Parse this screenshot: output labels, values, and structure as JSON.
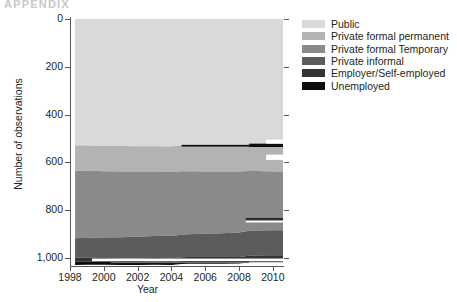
{
  "running_head": "APPENDIX",
  "chart_data": {
    "type": "area",
    "stacked": true,
    "title": "",
    "xlabel": "Year",
    "ylabel": "Number of observations",
    "xlim": [
      1998,
      2010.6
    ],
    "ylim": [
      0,
      1030
    ],
    "y_inverted": true,
    "grid": false,
    "legend_position": "right",
    "x_ticks": [
      1998,
      2000,
      2002,
      2004,
      2006,
      2008,
      2010
    ],
    "x_tick_labels": [
      "1998",
      "2000",
      "2002",
      "2004",
      "2006",
      "2008",
      "2010"
    ],
    "y_ticks": [
      0,
      200,
      400,
      600,
      800,
      1000
    ],
    "y_tick_labels": [
      "0",
      "200",
      "400",
      "600",
      "800",
      "1,000"
    ],
    "x": [
      1998.3,
      1999,
      2000,
      2001,
      2002,
      2003,
      2004,
      2004.6,
      2005,
      2006,
      2007,
      2008,
      2008.6,
      2009,
      2010,
      2010.6
    ],
    "series": [
      {
        "name": "Public",
        "color": "#d9d9d9",
        "values": [
          530,
          530,
          532,
          532,
          533,
          533,
          534,
          529,
          529,
          529,
          529,
          529,
          524,
          524,
          525,
          525
        ]
      },
      {
        "name": "Private formal permanent",
        "color": "#b3b3b3",
        "values": [
          105,
          105,
          105,
          106,
          106,
          106,
          107,
          108,
          108,
          109,
          110,
          110,
          112,
          112,
          113,
          113
        ]
      },
      {
        "name": "Private formal Temporary",
        "color": "#8a8a8a",
        "values": [
          283,
          281,
          278,
          276,
          273,
          270,
          267,
          266,
          264,
          261,
          258,
          255,
          251,
          250,
          247,
          247
        ]
      },
      {
        "name": "Private informal",
        "color": "#5c5c5c",
        "values": [
          82,
          84,
          86,
          88,
          90,
          92,
          94,
          95,
          96,
          98,
          100,
          102,
          104,
          105,
          107,
          107
        ]
      },
      {
        "name": "Employer/Self-employed",
        "color": "#343434",
        "values": [
          15,
          15,
          15,
          15,
          15,
          15,
          15,
          15,
          15,
          15,
          15,
          15,
          15,
          15,
          15,
          15
        ]
      },
      {
        "name": "Unemployed",
        "color": "#0d0d0d",
        "values": [
          15,
          14,
          13,
          13,
          13,
          13,
          13,
          13,
          13,
          13,
          13,
          13,
          13,
          13,
          13,
          13
        ]
      }
    ],
    "legend": [
      {
        "label": "Public",
        "color": "#d9d9d9"
      },
      {
        "label": "Private formal permanent",
        "color": "#b3b3b3"
      },
      {
        "label": "Private formal Temporary",
        "color": "#8a8a8a"
      },
      {
        "label": "Private informal",
        "color": "#5c5c5c"
      },
      {
        "label": "Employer/Self-employed",
        "color": "#343434"
      },
      {
        "label": "Unemployed",
        "color": "#0d0d0d"
      }
    ],
    "annotations": [
      {
        "name": "unemployed-band-upper",
        "note": "thin black band emerging at ~y=530 from 2004.6 onward"
      },
      {
        "name": "white-gap-right",
        "note": "white notch at right edge above and below upper black band"
      },
      {
        "name": "white-gap-bottom",
        "note": "white stripe below dark bands near y=1000"
      }
    ]
  }
}
